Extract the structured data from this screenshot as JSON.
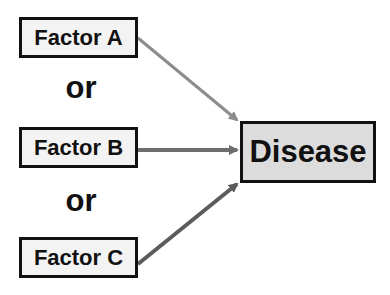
{
  "diagram": {
    "factors": [
      {
        "label": "Factor A",
        "arrow_color": "#8c8c8c"
      },
      {
        "label": "Factor B",
        "arrow_color": "#6e6e6e"
      },
      {
        "label": "Factor C",
        "arrow_color": "#5c5c5c"
      }
    ],
    "connectors": [
      "or",
      "or"
    ],
    "outcome": {
      "label": "Disease",
      "fill_color": "#dcdcdc"
    },
    "edges": [
      {
        "from": "Factor A",
        "to": "Disease"
      },
      {
        "from": "Factor B",
        "to": "Disease"
      },
      {
        "from": "Factor C",
        "to": "Disease"
      }
    ]
  }
}
